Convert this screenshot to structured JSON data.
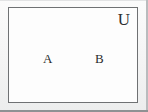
{
  "figure": {
    "type": "venn-diagram",
    "universe": {
      "label": "U",
      "label_position": "top-right"
    },
    "sets": [
      {
        "id": "A",
        "label": "A",
        "position": "left"
      },
      {
        "id": "B",
        "label": "B",
        "position": "right"
      }
    ],
    "regions": [
      "A only",
      "A intersect B",
      "B only",
      "complement of A union B"
    ],
    "colors": {
      "circle_fill": "#cdd1d4",
      "circle_stroke": "#4a4c4e",
      "rect_stroke": "#6f7173",
      "rect_fill": "#fdfdfd",
      "page_background": "#f4f4f4",
      "label_text": "#2b2c2d"
    }
  }
}
